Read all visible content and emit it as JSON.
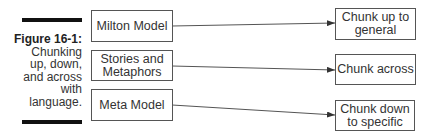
{
  "caption": {
    "figure_label": "Figure 16-1:",
    "lines": [
      "Chunking",
      "up, down,",
      "and across",
      "with",
      "language."
    ]
  },
  "sources": [
    {
      "label_lines": [
        "Milton Model"
      ]
    },
    {
      "label_lines": [
        "Stories and",
        "Metaphors"
      ]
    },
    {
      "label_lines": [
        "Meta Model"
      ]
    }
  ],
  "targets": [
    {
      "label_lines": [
        "Chunk up to",
        "general"
      ]
    },
    {
      "label_lines": [
        "Chunk across"
      ]
    },
    {
      "label_lines": [
        "Chunk down",
        "to specific"
      ]
    }
  ],
  "connections": [
    {
      "from": "Milton Model",
      "to": "Chunk up to general"
    },
    {
      "from": "Stories and Metaphors",
      "to": "Chunk across"
    },
    {
      "from": "Meta Model",
      "to": "Chunk down to specific"
    }
  ]
}
